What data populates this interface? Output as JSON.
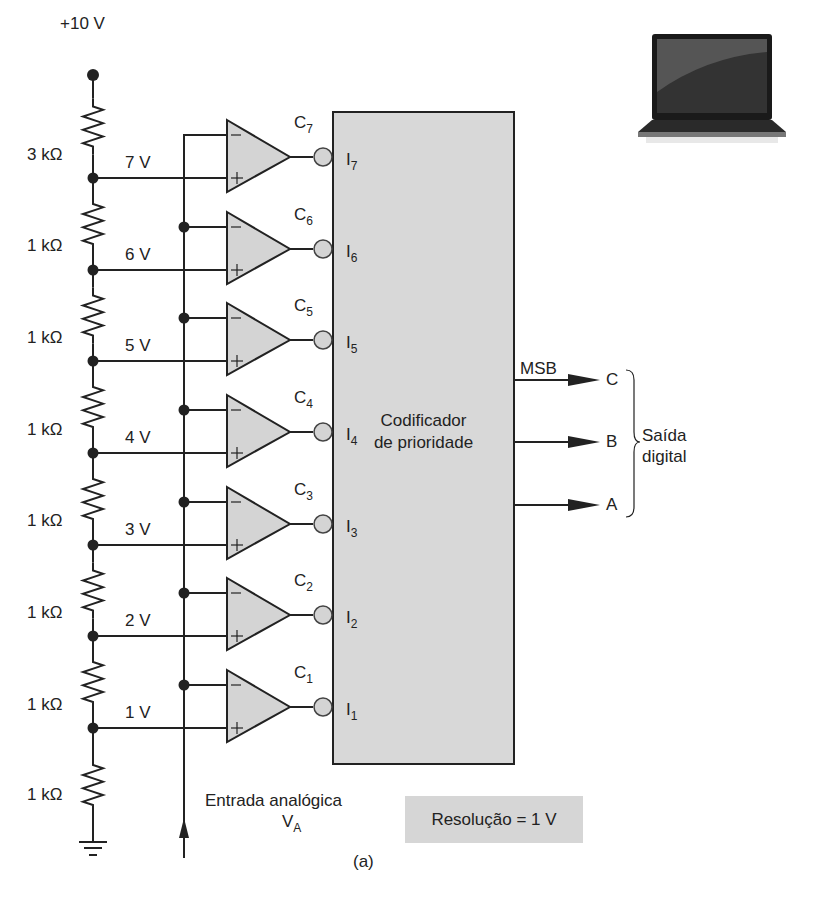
{
  "supply": {
    "label": "+10 V"
  },
  "resistors": [
    {
      "label": "3 kΩ",
      "y": 155
    },
    {
      "label": "1 kΩ",
      "y": 246
    },
    {
      "label": "1 kΩ",
      "y": 338
    },
    {
      "label": "1 kΩ",
      "y": 430
    },
    {
      "label": "1 kΩ",
      "y": 521
    },
    {
      "label": "1 kΩ",
      "y": 613
    },
    {
      "label": "1 kΩ",
      "y": 705
    },
    {
      "label": "1 kΩ",
      "y": 795
    }
  ],
  "taps": [
    {
      "voltage": "7 V",
      "y": 178
    },
    {
      "voltage": "6 V",
      "y": 270
    },
    {
      "voltage": "5 V",
      "y": 361
    },
    {
      "voltage": "4 V",
      "y": 453
    },
    {
      "voltage": "3 V",
      "y": 545
    },
    {
      "voltage": "2 V",
      "y": 636
    },
    {
      "voltage": "1 V",
      "y": 728
    }
  ],
  "comparators": [
    {
      "name": "C",
      "sub": "7",
      "input": "I",
      "input_sub": "7",
      "top": 120
    },
    {
      "name": "C",
      "sub": "6",
      "input": "I",
      "input_sub": "6",
      "top": 212
    },
    {
      "name": "C",
      "sub": "5",
      "input": "I",
      "input_sub": "5",
      "top": 303
    },
    {
      "name": "C",
      "sub": "4",
      "input": "I",
      "input_sub": "4",
      "top": 395
    },
    {
      "name": "C",
      "sub": "3",
      "input": "I",
      "input_sub": "3",
      "top": 487
    },
    {
      "name": "C",
      "sub": "2",
      "input": "I",
      "input_sub": "2",
      "top": 578
    },
    {
      "name": "C",
      "sub": "1",
      "input": "I",
      "input_sub": "1",
      "top": 670
    }
  ],
  "encoder": {
    "line1": "Codificador",
    "line2": "de prioridade",
    "fill": "#d8d8d8"
  },
  "outputs": {
    "msb_label": "MSB",
    "lines": [
      {
        "label": "C",
        "y": 380
      },
      {
        "label": "B",
        "y": 442
      },
      {
        "label": "A",
        "y": 505
      }
    ],
    "group_label_line1": "Saída",
    "group_label_line2": "digital"
  },
  "analog_input": {
    "line1": "Entrada analógica",
    "symbol": "V",
    "symbol_sub": "A"
  },
  "resolution": {
    "text": "Resolução = 1 V"
  },
  "caption": "(a)",
  "colors": {
    "line": "#222222",
    "comparator_fill": "#d4d4d4",
    "box_fill": "#d8d8d8"
  }
}
